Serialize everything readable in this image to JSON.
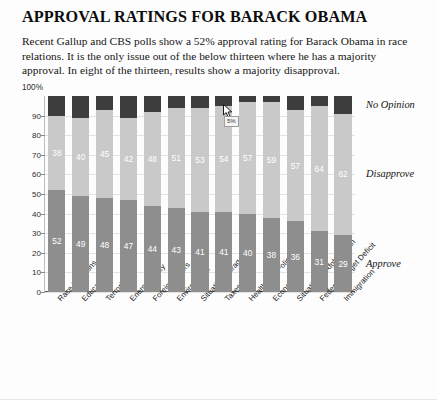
{
  "headline": "APPROVAL RATINGS FOR BARACK OBAMA",
  "deck": "Recent Gallup and CBS polls show a 52% approval rating for Barack Obama in race relations. It is the only issue out of the below thirteen where he has a majority approval. In eight of the thirteen, results show a majority disapproval.",
  "axis": {
    "y_top_label": "100%",
    "y_ticks": [
      "0",
      "10",
      "20",
      "30",
      "40",
      "50",
      "60",
      "70",
      "80",
      "90"
    ]
  },
  "legend": {
    "no_opinion": "No Opinion",
    "disapprove": "Disapprove",
    "approve": "Approve"
  },
  "colors": {
    "approve": "#8e8e8e",
    "disapprove": "#c9c9c9",
    "no_opinion": "#3d3d3d",
    "axis": "#5e5e5e",
    "grid": "#e3e3e3",
    "background": "#fdfdfd",
    "text": "#111111"
  },
  "tooltip": {
    "text": "5%"
  },
  "chart_data": {
    "type": "bar",
    "title": "APPROVAL RATINGS FOR BARACK OBAMA",
    "xlabel": "",
    "ylabel": "",
    "ylim": [
      0,
      100
    ],
    "grid": true,
    "stacked": true,
    "legend_position": "right",
    "categories": [
      "Race Relations",
      "Education",
      "Terrorism",
      "Energy Policy",
      "Foreign Affairs",
      "Environment",
      "Situation in Iraq",
      "Taxes",
      "Healthcare Policy",
      "Economy",
      "Situation in Afghanistan",
      "Federal Budget Deficit",
      "Immigration"
    ],
    "series": [
      {
        "name": "Approve",
        "color": "#8e8e8e",
        "values": [
          52,
          49,
          48,
          47,
          44,
          43,
          41,
          41,
          40,
          38,
          36,
          31,
          29
        ]
      },
      {
        "name": "Disapprove",
        "color": "#c9c9c9",
        "values": [
          38,
          40,
          45,
          42,
          48,
          51,
          53,
          54,
          57,
          59,
          57,
          64,
          62
        ]
      },
      {
        "name": "No Opinion",
        "color": "#3d3d3d",
        "values": [
          10,
          11,
          7,
          11,
          8,
          6,
          6,
          5,
          3,
          3,
          7,
          5,
          9
        ]
      }
    ]
  }
}
